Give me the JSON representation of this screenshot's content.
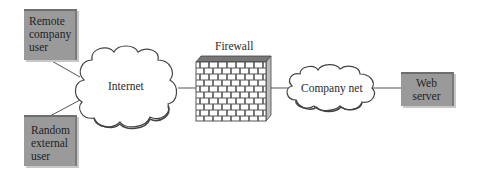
{
  "diagram": {
    "type": "network topology",
    "nodes": [
      {
        "id": "remote-user",
        "label": "Remote\ncompany\nuser",
        "shape": "box"
      },
      {
        "id": "random-user",
        "label": "Random\nexternal\nuser",
        "shape": "box"
      },
      {
        "id": "internet",
        "label": "Internet",
        "shape": "cloud"
      },
      {
        "id": "firewall",
        "label": "Firewall",
        "shape": "brick-wall"
      },
      {
        "id": "company-net",
        "label": "Company net",
        "shape": "cloud"
      },
      {
        "id": "web-server",
        "label": "Web\nserver",
        "shape": "box"
      }
    ],
    "edges": [
      {
        "from": "remote-user",
        "to": "internet"
      },
      {
        "from": "random-user",
        "to": "internet"
      },
      {
        "from": "internet",
        "to": "firewall"
      },
      {
        "from": "firewall",
        "to": "company-net"
      },
      {
        "from": "company-net",
        "to": "web-server"
      }
    ]
  },
  "labels": {
    "remote_user": "Remote\ncompany\nuser",
    "random_user": "Random\nexternal\nuser",
    "internet": "Internet",
    "firewall": "Firewall",
    "company_net": "Company net",
    "web_server": "Web\nserver"
  },
  "colors": {
    "box_fill": "#9a9a9a",
    "line": "#555555",
    "cloud_fill": "#ffffff"
  }
}
